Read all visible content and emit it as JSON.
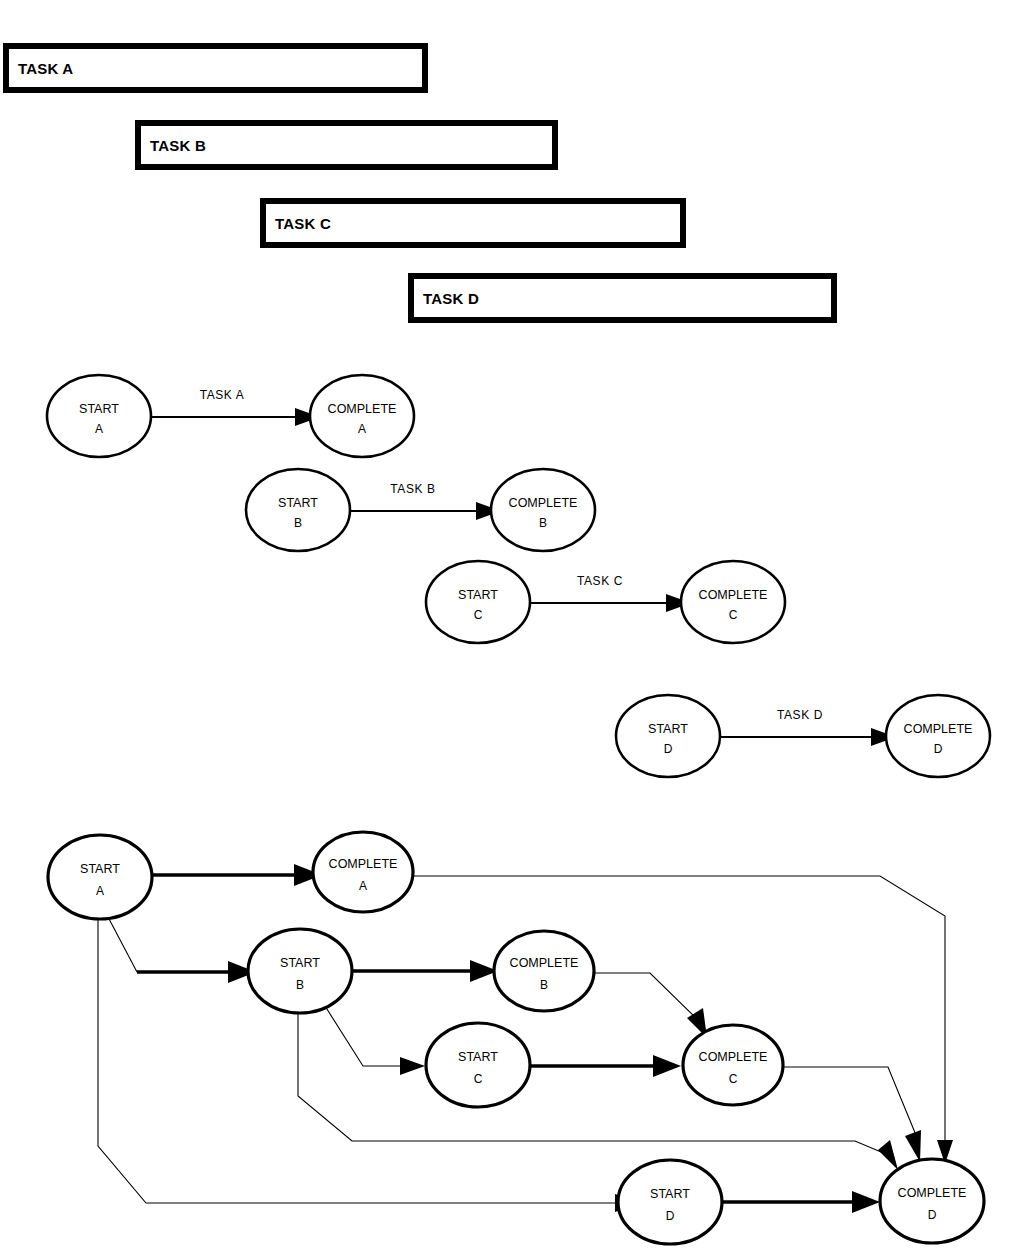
{
  "page": {
    "background_color": "#ffffff",
    "line_color": "#000000",
    "width": 1017,
    "height": 1260
  },
  "gantt": {
    "section_name": "task-duration-bars",
    "bars": [
      {
        "label": "TASK A",
        "x": 3,
        "y": 43,
        "width": 425,
        "height": 50
      },
      {
        "label": "TASK B",
        "x": 135,
        "y": 120,
        "width": 423,
        "height": 50
      },
      {
        "label": "TASK C",
        "x": 260,
        "y": 198,
        "width": 426,
        "height": 50
      },
      {
        "label": "TASK D",
        "x": 408,
        "y": 273,
        "width": 429,
        "height": 50
      }
    ]
  },
  "simple_networks": {
    "section_name": "individual-task-arrow-diagrams",
    "rows": [
      {
        "edge_label": "TASK A",
        "start": {
          "line1": "START",
          "line2": "A",
          "cx": 99,
          "cy": 416
        },
        "complete": {
          "line1": "COMPLETE",
          "line2": "A",
          "cx": 362,
          "cy": 416
        }
      },
      {
        "edge_label": "TASK B",
        "start": {
          "line1": "START",
          "line2": "B",
          "cx": 298,
          "cy": 510
        },
        "complete": {
          "line1": "COMPLETE",
          "line2": "B",
          "cx": 543,
          "cy": 510
        }
      },
      {
        "edge_label": "TASK C",
        "start": {
          "line1": "START",
          "line2": "C",
          "cx": 478,
          "cy": 602
        },
        "complete": {
          "line1": "COMPLETE",
          "line2": "C",
          "cx": 733,
          "cy": 602
        }
      },
      {
        "edge_label": "TASK D",
        "start": {
          "line1": "START",
          "line2": "D",
          "cx": 668,
          "cy": 736
        },
        "complete": {
          "line1": "COMPLETE",
          "line2": "D",
          "cx": 938,
          "cy": 736
        }
      }
    ]
  },
  "combined_network": {
    "section_name": "combined-dependency-network",
    "nodes": [
      {
        "id": "start-a",
        "line1": "START",
        "line2": "A",
        "cx": 100,
        "cy": 877,
        "rx": 52,
        "ry": 42
      },
      {
        "id": "complete-a",
        "line1": "COMPLETE",
        "line2": "A",
        "cx": 363,
        "cy": 872,
        "rx": 50,
        "ry": 40
      },
      {
        "id": "start-b",
        "line1": "START",
        "line2": "B",
        "cx": 300,
        "cy": 971,
        "rx": 52,
        "ry": 42
      },
      {
        "id": "complete-b",
        "line1": "COMPLETE",
        "line2": "B",
        "cx": 544,
        "cy": 971,
        "rx": 50,
        "ry": 40
      },
      {
        "id": "start-c",
        "line1": "START",
        "line2": "C",
        "cx": 478,
        "cy": 1065,
        "rx": 52,
        "ry": 42
      },
      {
        "id": "complete-c",
        "line1": "COMPLETE",
        "line2": "C",
        "cx": 733,
        "cy": 1065,
        "rx": 50,
        "ry": 40
      },
      {
        "id": "start-d",
        "line1": "START",
        "line2": "D",
        "cx": 670,
        "cy": 1202,
        "rx": 52,
        "ry": 42
      },
      {
        "id": "complete-d",
        "line1": "COMPLETE",
        "line2": "D",
        "cx": 932,
        "cy": 1201,
        "rx": 52,
        "ry": 42
      }
    ],
    "edges": [
      {
        "id": "start-a-to-complete-a",
        "from": "start-a",
        "to": "complete-a",
        "weight": "thick"
      },
      {
        "id": "start-a-to-start-b",
        "from": "start-a",
        "to": "start-b",
        "weight": "mixed"
      },
      {
        "id": "start-a-to-start-d",
        "from": "start-a",
        "to": "start-d",
        "weight": "thin"
      },
      {
        "id": "start-b-to-complete-b",
        "from": "start-b",
        "to": "complete-b",
        "weight": "thick"
      },
      {
        "id": "start-b-to-start-c",
        "from": "start-b",
        "to": "start-c",
        "weight": "mixed"
      },
      {
        "id": "start-b-to-complete-d",
        "from": "start-b",
        "to": "complete-d",
        "weight": "thin"
      },
      {
        "id": "complete-a-to-complete-d",
        "from": "complete-a",
        "to": "complete-d",
        "weight": "thin"
      },
      {
        "id": "complete-b-to-complete-c",
        "from": "complete-b",
        "to": "complete-c",
        "weight": "thin"
      },
      {
        "id": "start-c-to-complete-c",
        "from": "start-c",
        "to": "complete-c",
        "weight": "thick"
      },
      {
        "id": "complete-c-to-complete-d",
        "from": "complete-c",
        "to": "complete-d",
        "weight": "thin"
      },
      {
        "id": "start-d-to-complete-d",
        "from": "start-d",
        "to": "complete-d",
        "weight": "thick"
      }
    ]
  }
}
